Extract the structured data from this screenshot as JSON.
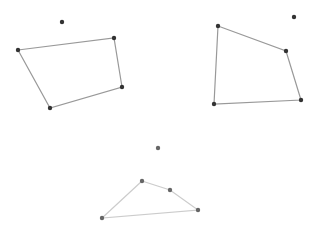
{
  "canvas": {
    "width": 314,
    "height": 236,
    "background": "#ffffff"
  },
  "colors": {
    "dark_point": "#333333",
    "dark_line": "#999999",
    "light_point": "#666666",
    "light_line": "#cccccc"
  },
  "figures": [
    {
      "name": "quad-top-left",
      "stray_point": [
        62,
        22
      ],
      "polygon": [
        [
          18,
          50
        ],
        [
          114,
          38
        ],
        [
          122,
          87
        ],
        [
          50,
          108
        ]
      ],
      "style": "dark"
    },
    {
      "name": "quad-top-right",
      "stray_point": [
        294,
        17
      ],
      "polygon": [
        [
          218,
          26
        ],
        [
          286,
          51
        ],
        [
          301,
          100
        ],
        [
          214,
          104
        ]
      ],
      "style": "dark"
    },
    {
      "name": "quad-bottom",
      "stray_point": [
        158,
        148
      ],
      "polygon": [
        [
          142,
          181
        ],
        [
          170,
          190
        ],
        [
          198,
          210
        ],
        [
          102,
          218
        ]
      ],
      "style": "light"
    }
  ]
}
